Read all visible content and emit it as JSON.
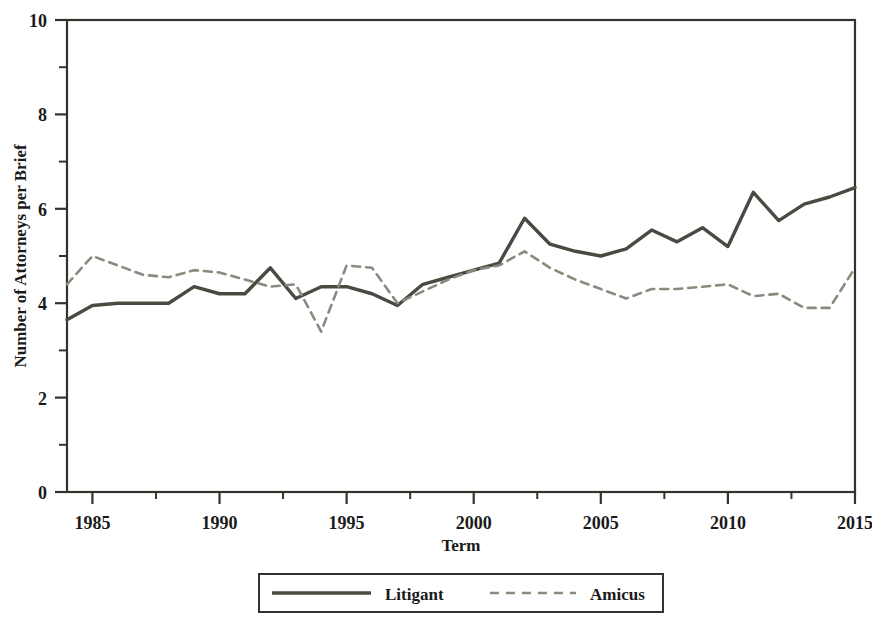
{
  "chart_data": {
    "type": "line",
    "title": "",
    "xlabel": "Term",
    "ylabel": "Number of Attorneys per Brief",
    "xlim": [
      1984,
      2015
    ],
    "ylim": [
      0,
      10
    ],
    "xticks": [
      1985,
      1990,
      1995,
      2000,
      2005,
      2010,
      2015
    ],
    "yticks": [
      0,
      2,
      4,
      6,
      8,
      10
    ],
    "xminorticks": [
      1987.5,
      1992.5,
      1997.5,
      2002.5,
      2007.5,
      2012.5
    ],
    "yminorticks": [
      1,
      3,
      5,
      7,
      9
    ],
    "grid": false,
    "legend_position": "below-center",
    "x": [
      1984,
      1985,
      1986,
      1987,
      1988,
      1989,
      1990,
      1991,
      1992,
      1993,
      1994,
      1995,
      1996,
      1997,
      1998,
      1999,
      2000,
      2001,
      2002,
      2003,
      2004,
      2005,
      2006,
      2007,
      2008,
      2009,
      2010,
      2011,
      2012,
      2013,
      2014,
      2015
    ],
    "series": [
      {
        "name": "Litigant",
        "style": "solid",
        "color": "#4a4a42",
        "values": [
          3.65,
          3.95,
          4.0,
          4.0,
          4.0,
          4.35,
          4.2,
          4.2,
          4.75,
          4.1,
          4.35,
          4.35,
          4.2,
          3.95,
          4.4,
          4.55,
          4.7,
          4.85,
          5.8,
          5.25,
          5.1,
          5.0,
          5.15,
          5.55,
          5.3,
          5.6,
          5.2,
          6.35,
          5.75,
          6.1,
          6.25,
          6.45
        ]
      },
      {
        "name": "Amicus",
        "style": "dashed",
        "color": "#8a8a7e",
        "values": [
          4.4,
          5.0,
          4.8,
          4.6,
          4.55,
          4.7,
          4.65,
          4.5,
          4.35,
          4.4,
          3.4,
          4.8,
          4.75,
          4.0,
          4.25,
          4.5,
          4.7,
          4.8,
          5.1,
          4.75,
          4.5,
          4.3,
          4.1,
          4.3,
          4.3,
          4.35,
          4.4,
          4.15,
          4.2,
          3.9,
          3.9,
          4.75
        ]
      }
    ]
  },
  "axes": {
    "ylabel": "Number of Attorneys per Brief",
    "xlabel": "Term",
    "ytick_labels": [
      "0",
      "2",
      "4",
      "6",
      "8",
      "10"
    ],
    "xtick_labels": [
      "1985",
      "1990",
      "1995",
      "2000",
      "2005",
      "2010",
      "2015"
    ]
  },
  "legend": {
    "entries": [
      {
        "label": "Litigant",
        "style": "solid"
      },
      {
        "label": "Amicus",
        "style": "dashed"
      }
    ]
  },
  "colors": {
    "litigant": "#4a4a42",
    "amicus": "#8a8a7e",
    "axis": "#33332e",
    "background": "#ffffff"
  }
}
